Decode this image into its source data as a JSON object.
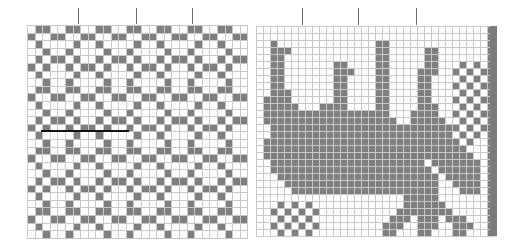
{
  "page": {
    "width": 508,
    "height": 252,
    "background": "#ffffff"
  },
  "colors": {
    "filled": "#7f7f7f",
    "empty": "#ffffff",
    "grid_line": "#c9c9c9",
    "tick": "#6e6e6e",
    "rule": "#111111",
    "edge_band": "#7b7b7b"
  },
  "chart_data": {
    "type": "heatmap",
    "xlabel": "",
    "ylabel": "",
    "grid": true,
    "legend": "none",
    "panels": [
      {
        "name": "left-panel-geometric-repeat",
        "origin_x": 27,
        "origin_y": 25,
        "cell": 7.6,
        "cols": 29,
        "rows": 28,
        "cell_value_legend": {
          "0": "empty",
          "1": "filled"
        },
        "rows_data": [
          "01100110011001100110011001100",
          "10011001100110011001100110011",
          "01000010010000100100001001000",
          "00100100001001000010010000100",
          "01011010010110100101101001011",
          "10100101101001011010010110100",
          "01000010010000100100001001000",
          "00100100001001000010010000100",
          "01100110011001100110011001100",
          "10011001100110011001100110011",
          "01000010010000100100001001000",
          "00100100001001000010010000100",
          "01011010010110100101101001011",
          "10100101101001011010010110100",
          "01000010010000100100001001000",
          "00100100001001000010010000100",
          "01100110011001100110011001100",
          "10011001100110011001100110011",
          "01000010010000100100001001000",
          "00100100001001000010010000100",
          "01011010010110100101101001011",
          "10100101101001011010010110100",
          "01000010010000100100001001000",
          "00100100001001000010010000100",
          "01100110011001100110011001100",
          "10011001100110011001100110011",
          "01000010010000100100001001000",
          "00100100001001000010010000100"
        ],
        "ticks": [
          {
            "x": 78,
            "y_top": 8,
            "height": 16
          },
          {
            "x": 136,
            "y_top": 8,
            "height": 16
          },
          {
            "x": 192,
            "y_top": 8,
            "height": 16
          }
        ],
        "rules": [
          {
            "x": 41,
            "y": 130,
            "width": 88
          }
        ]
      },
      {
        "name": "right-panel-figurative-motif",
        "origin_x": 256,
        "origin_y": 26,
        "cell": 7.0,
        "cols": 34,
        "rows": 30,
        "cell_value_legend": {
          "0": "empty",
          "1": "filled"
        },
        "rows_data": [
          "0000000000000000000000000000000001",
          "0000000000000000000000000000000001",
          "0010000000000000011000000000000001",
          "0011100000000000011000001100000001",
          "0011000000000000011000001100000001",
          "0011000000011000011000001100010101",
          "0011000000011100011000011100101011",
          "0011000000011000011000011000010101",
          "0011000000011000011000011000101011",
          "0011100000011000011000011000010101",
          "0111100000011000011000011000101011",
          "0111110001111000011000011100010101",
          "0111111111111111111000111100101011",
          "0111111111111111111100111110010101",
          "0011111111111111111111111111101011",
          "0011111111111111111111111111010101",
          "0111111111111111111111111111101001",
          "0111111111111111111111111111110001",
          "0111111111111111111111111111111001",
          "0011111111111111111111110111111101",
          "0011111111111111111111111011111101",
          "0001111111111111111111111101111101",
          "0000111111111111111111111100111101",
          "0000011111111111111111111100011101",
          "0000000000000000000001111100000001",
          "0001010100000000000001111110000001",
          "0010101010000000000011111111000001",
          "0001010100000000000111011101110001",
          "0010101010000000001110011100111001",
          "0001010100000000001100011000110001"
        ],
        "ticks": [
          {
            "x": 302,
            "y_top": 8,
            "height": 17
          },
          {
            "x": 358,
            "y_top": 8,
            "height": 17
          },
          {
            "x": 416,
            "y_top": 8,
            "height": 17
          }
        ],
        "edge_bands": [
          {
            "x": 490,
            "y": 26,
            "width": 7,
            "height": 210
          }
        ]
      }
    ]
  }
}
